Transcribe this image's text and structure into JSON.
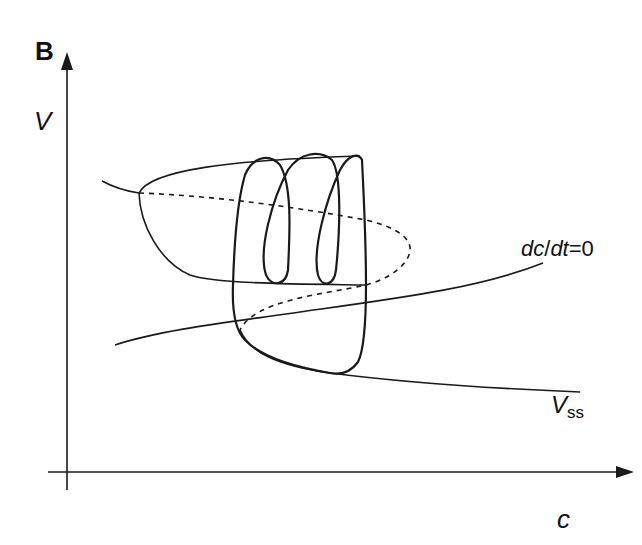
{
  "figure": {
    "panel_label": "B",
    "x_axis_label": "c",
    "y_axis_label": "V",
    "annotations": {
      "nullcline_dc": "dc",
      "nullcline_slash": "/",
      "nullcline_dt": "dt",
      "nullcline_eq": "=0",
      "vss_main": "V",
      "vss_sub": "ss"
    },
    "curves": [
      {
        "name": "V-nullcline (Z-shaped steady state)",
        "style": "solid",
        "stable_branches": [
          "upper",
          "lower"
        ],
        "unstable_branch": "middle (dashed)"
      },
      {
        "name": "dc/dt=0 nullcline",
        "style": "solid"
      },
      {
        "name": "Vss",
        "style": "solid"
      },
      {
        "name": "trajectory (bursting oscillation with spikes)",
        "style": "solid bold"
      },
      {
        "name": "unstable periodic orbit / middle branch",
        "style": "dashed"
      }
    ],
    "colors": {
      "stroke": "#1a1a1a",
      "background": "#ffffff"
    }
  }
}
